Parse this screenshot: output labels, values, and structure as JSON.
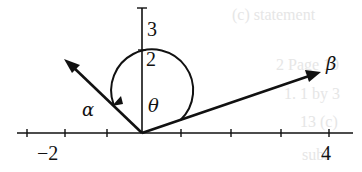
{
  "figure": {
    "x_axis": {
      "tick_labels": {
        "neg2": "−2",
        "pos4": "4"
      }
    },
    "y_axis": {
      "tick_labels": {
        "two": "2",
        "three": "3"
      }
    },
    "vectors": {
      "alpha_label": "α",
      "beta_label": "β"
    },
    "angle_label": "θ",
    "background_bleed": [
      "(c) statement",
      "2 Page 10",
      "1. 1 by 3",
      "13 (c)",
      "subs"
    ]
  }
}
